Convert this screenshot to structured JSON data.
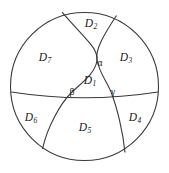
{
  "figure": {
    "caption_hidden": "",
    "type": "geometric-diagram",
    "stroke_color": "#3a3a3a",
    "fill_color": "#ffffff",
    "text_color": "#1a1a1a"
  },
  "sphere": {
    "outline_name": "sphere-outline-circle",
    "center_x": 84.5,
    "center_y": 86.5,
    "radius": 74
  },
  "arcs": [
    {
      "name": "equator-arc",
      "description": "horizontal great circle arc spanning the sphere, sagging slightly downward at center",
      "start": [
        11,
        92
      ],
      "end": [
        158,
        92
      ],
      "control": [
        84.5,
        102
      ]
    },
    {
      "name": "left-great-circle-arc",
      "description": "arc entering at upper left of the top rim, passing through vertex alpha and beta, exiting at lower left",
      "start": [
        62,
        12
      ],
      "end": [
        42,
        149
      ],
      "control_1": [
        84,
        45
      ],
      "control_2": [
        72,
        100
      ]
    },
    {
      "name": "right-great-circle-arc",
      "description": "arc entering at upper right of the top rim, passing through vertex alpha and gamma, exiting at lower right",
      "start": [
        116,
        15
      ],
      "end": [
        125,
        152
      ],
      "control_1": [
        96,
        46
      ],
      "control_2": [
        110,
        100
      ]
    }
  ],
  "vertices": [
    {
      "name": "vertex-alpha",
      "label": "α",
      "x": 97,
      "y": 60
    },
    {
      "name": "vertex-beta",
      "label": "β",
      "x": 71,
      "y": 93
    },
    {
      "name": "vertex-gamma",
      "label": "γ",
      "x": 111,
      "y": 92
    }
  ],
  "regions": [
    {
      "name": "region-d1",
      "letter": "D",
      "subscript": "1",
      "x": 90,
      "y": 81
    },
    {
      "name": "region-d2",
      "letter": "D",
      "subscript": "2",
      "x": 91,
      "y": 24
    },
    {
      "name": "region-d3",
      "letter": "D",
      "subscript": "3",
      "x": 126,
      "y": 58
    },
    {
      "name": "region-d4",
      "letter": "D",
      "subscript": "4",
      "x": 135,
      "y": 118
    },
    {
      "name": "region-d5",
      "letter": "D",
      "subscript": "5",
      "x": 85,
      "y": 128
    },
    {
      "name": "region-d6",
      "letter": "D",
      "subscript": "6",
      "x": 31,
      "y": 118
    },
    {
      "name": "region-d7",
      "letter": "D",
      "subscript": "7",
      "x": 45,
      "y": 58
    }
  ]
}
